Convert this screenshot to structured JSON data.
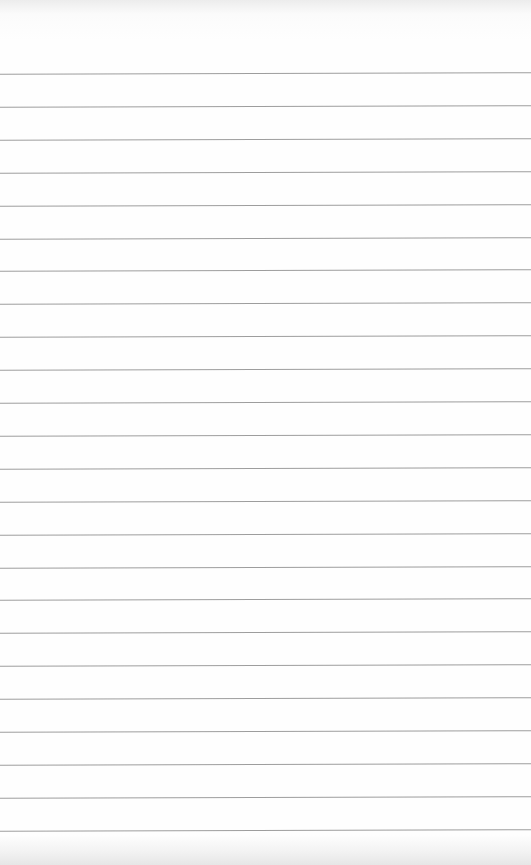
{
  "page": {
    "type": "blank ruled paper",
    "line_color": "#8c8c8c",
    "background_color": "#fdfdfd",
    "first_line_y": 73,
    "line_spacing": 32.9,
    "line_count": 24
  }
}
